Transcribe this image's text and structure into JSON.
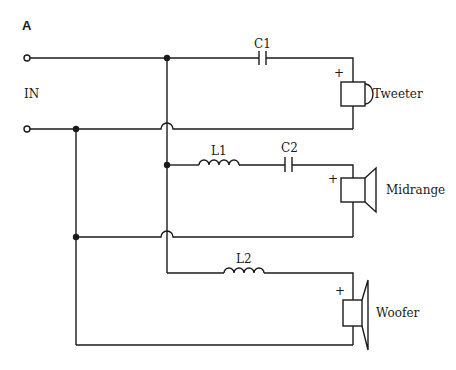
{
  "figure": {
    "panel_label": "A",
    "input_label": "IN",
    "plus_sign": "+"
  },
  "components": {
    "c1": "C1",
    "c2": "C2",
    "l1": "L1",
    "l2": "L2"
  },
  "speakers": {
    "tweeter": "Tweeter",
    "midrange": "Midrange",
    "woofer": "Woofer"
  },
  "colors": {
    "ink": "#1a1a1a",
    "background": "#ffffff"
  }
}
